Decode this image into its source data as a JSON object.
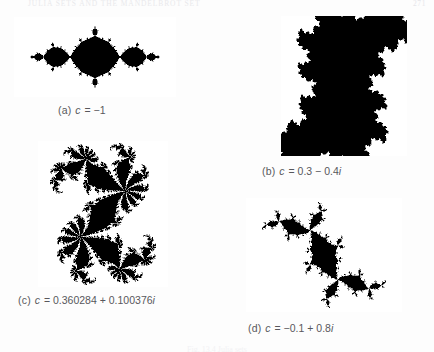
{
  "page": {
    "running_head": "JULIA SETS AND THE MANDELBROT SET",
    "page_number": "271",
    "figure_caption": "Fig. 13.4  Julia sets"
  },
  "figures": [
    {
      "id": "a",
      "label": "(a)",
      "variable": "c",
      "equals": "=",
      "value": "−1",
      "caption_text": "(a)  c = −1",
      "julia_c": {
        "re": -1.0,
        "im": 0.0
      },
      "bounds": {
        "x": 14,
        "y": 17,
        "w": 162,
        "h": 80
      },
      "color": "#000000"
    },
    {
      "id": "b",
      "label": "(b)",
      "variable": "c",
      "equals": "=",
      "value": "0.3 − 0.4i",
      "caption_text": "(b)  c = 0.3 − 0.4i",
      "julia_c": {
        "re": 0.3,
        "im": -0.4
      },
      "bounds": {
        "x": 281,
        "y": 16,
        "w": 126,
        "h": 140
      },
      "color": "#000000"
    },
    {
      "id": "c",
      "label": "(c)",
      "variable": "c",
      "equals": "=",
      "value": "0.360284 + 0.100376i",
      "caption_text": "(c)  c = 0.360284 + 0.100376i",
      "julia_c": {
        "re": 0.360284,
        "im": 0.100376
      },
      "bounds": {
        "x": 38,
        "y": 141,
        "w": 130,
        "h": 146
      },
      "color": "#000000"
    },
    {
      "id": "d",
      "label": "(d)",
      "variable": "c",
      "equals": "=",
      "value": "−0.1 + 0.8i",
      "caption_text": "(d)  c = −0.1 + 0.8i",
      "julia_c": {
        "re": -0.1,
        "im": 0.8
      },
      "bounds": {
        "x": 246,
        "y": 198,
        "w": 156,
        "h": 114
      },
      "color": "#000000"
    }
  ],
  "captions": [
    {
      "id": "a",
      "x": 58,
      "y": 104,
      "label": "(a)",
      "var": "c",
      "eq": "=",
      "value": "−1"
    },
    {
      "id": "b",
      "x": 262,
      "y": 165,
      "label": "(b)",
      "var": "c",
      "eq": "=",
      "value": "0.3 − 0.4",
      "imag": "i"
    },
    {
      "id": "c",
      "x": 18,
      "y": 294,
      "label": "(c)",
      "var": "c",
      "eq": "=",
      "value": "0.360284 + 0.100376",
      "imag": "i"
    },
    {
      "id": "d",
      "x": 248,
      "y": 322,
      "label": "(d)",
      "var": "c",
      "eq": "=",
      "value": "−0.1 + 0.8",
      "imag": "i"
    }
  ]
}
